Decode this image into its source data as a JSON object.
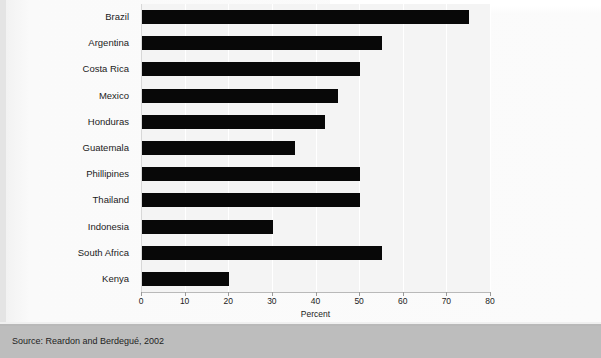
{
  "figure": {
    "background_color": "#fbfbfb",
    "plot_background_color": "#f4f4f4",
    "bar_color": "#080808",
    "gridline_color": "#ffffff"
  },
  "source": {
    "text": "Source: Reardon and Berdegué, 2002",
    "band_color": "#bdbdbd"
  },
  "chart_data": {
    "type": "bar",
    "orientation": "horizontal",
    "title": "",
    "subtitle": "",
    "xlabel": "Percent",
    "ylabel": "",
    "xlim": [
      0,
      80
    ],
    "ylim": [
      0,
      11
    ],
    "grid": true,
    "grid_axis": "x",
    "legend": false,
    "legend_position": "none",
    "xticks": [
      0,
      10,
      20,
      30,
      40,
      50,
      60,
      70,
      80
    ],
    "xticklabels": [
      "0",
      "10",
      "20",
      "30",
      "40",
      "50",
      "60",
      "70",
      "80"
    ],
    "categories": [
      "Brazil",
      "Argentina",
      "Costa Rica",
      "Mexico",
      "Honduras",
      "Guatemala",
      "Phillipines",
      "Thailand",
      "Indonesia",
      "South Africa",
      "Kenya"
    ],
    "values": [
      75,
      55,
      50,
      45,
      42,
      35,
      50,
      50,
      30,
      55,
      20
    ],
    "series": [
      {
        "name": "Supermarket share of food retail",
        "values": [
          75,
          55,
          50,
          45,
          42,
          35,
          50,
          50,
          30,
          55,
          20
        ]
      }
    ],
    "annotations": []
  }
}
